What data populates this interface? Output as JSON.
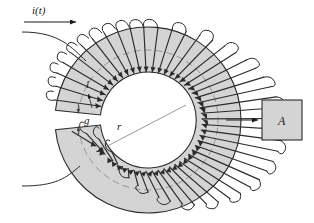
{
  "figure": {
    "labels": {
      "current": "i(t)",
      "mean_path": "l",
      "gap": "g",
      "radius": "r",
      "area_box": "A"
    },
    "colors": {
      "core_fill": "#d4d4d4",
      "core_stroke": "#2b2b2b",
      "winding": "#2b2b2b",
      "dashed_centerline": "#8c8c8c",
      "leader": "#8c8c8c",
      "box_fill": "#d4d4d4",
      "background": "#ffffff"
    },
    "geometry": {
      "center_x": 148,
      "center_y": 120,
      "outer_radius": 93,
      "inner_radius": 48,
      "mean_radius": 70,
      "gap_top_angle_deg": 186,
      "gap_bottom_angle_deg": 174,
      "winding_turns": 34
    },
    "box": {
      "x": 262,
      "y": 100,
      "width": 40,
      "height": 40
    }
  }
}
